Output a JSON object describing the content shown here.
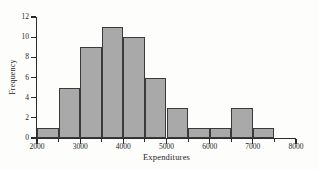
{
  "chart_data": {
    "type": "bar",
    "title": "",
    "subtitle": "",
    "xlabel": "Expenditures",
    "ylabel": "Frequency",
    "xlim": [
      2000,
      8000
    ],
    "ylim": [
      0,
      12
    ],
    "grid": false,
    "legend": null,
    "bin_width": 500,
    "bin_edges": [
      2000,
      2500,
      3000,
      3500,
      4000,
      4500,
      5000,
      5500,
      6000,
      6500,
      7000,
      7500,
      8000
    ],
    "categories": [
      "2000-2500",
      "2500-3000",
      "3000-3500",
      "3500-4000",
      "4000-4500",
      "4500-5000",
      "5000-5500",
      "5500-6000",
      "6000-6500",
      "6500-7000",
      "7000-7500",
      "7500-8000"
    ],
    "values": [
      1,
      5,
      9,
      11,
      10,
      6,
      3,
      1,
      1,
      3,
      1,
      0
    ],
    "xticks": [
      2000,
      3000,
      4000,
      5000,
      6000,
      7000,
      8000
    ],
    "xtick_labels": [
      "2000",
      "3000",
      "4000",
      "5000",
      "6000",
      "7000",
      "8000"
    ],
    "yticks": [
      0,
      2,
      4,
      6,
      8,
      10,
      12
    ],
    "ytick_labels": [
      "0",
      "2",
      "4",
      "6",
      "8",
      "10",
      "12"
    ],
    "colors": {
      "bar_fill": "#a9a9a9",
      "bar_edge": "#3a3a3a",
      "axis": "#2b2b2b",
      "text": "#1f1f1f",
      "background": "#fdfdfc"
    }
  }
}
